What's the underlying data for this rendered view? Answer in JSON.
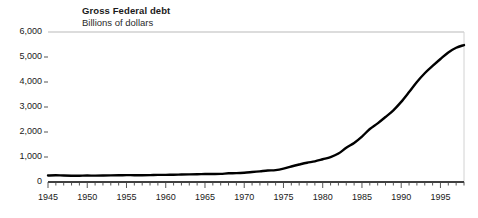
{
  "chart_data": {
    "type": "line",
    "title": "Gross Federal debt",
    "subtitle": "Billions of dollars",
    "xlabel": "",
    "ylabel": "",
    "ylim": [
      0,
      6000
    ],
    "xlim": [
      1945,
      1998
    ],
    "grid": "top-line-only",
    "legend": "none",
    "line_color": "#000000",
    "axis_color": "#000000",
    "gridline_color": "#b9b9b9",
    "ytick_labels": [
      "6,000",
      "5,000",
      "4,000",
      "3,000",
      "2,000",
      "1,000",
      "0"
    ],
    "ytick_values": [
      6000,
      5000,
      4000,
      3000,
      2000,
      1000,
      0
    ],
    "xtick_labels": [
      "1945",
      "1950",
      "1955",
      "1960",
      "1965",
      "1970",
      "1975",
      "1980",
      "1985",
      "1990",
      "1995"
    ],
    "xtick_values": [
      1945,
      1950,
      1955,
      1960,
      1965,
      1970,
      1975,
      1980,
      1985,
      1990,
      1995
    ],
    "x": [
      1945,
      1946,
      1947,
      1948,
      1949,
      1950,
      1951,
      1952,
      1953,
      1954,
      1955,
      1956,
      1957,
      1958,
      1959,
      1960,
      1961,
      1962,
      1963,
      1964,
      1965,
      1966,
      1967,
      1968,
      1969,
      1970,
      1971,
      1972,
      1973,
      1974,
      1975,
      1976,
      1977,
      1978,
      1979,
      1980,
      1981,
      1982,
      1983,
      1984,
      1985,
      1986,
      1987,
      1988,
      1989,
      1990,
      1991,
      1992,
      1993,
      1994,
      1995,
      1996,
      1997,
      1998
    ],
    "values": [
      260,
      271,
      257,
      252,
      253,
      257,
      255,
      259,
      266,
      271,
      274,
      273,
      271,
      276,
      285,
      286,
      289,
      298,
      306,
      312,
      317,
      320,
      326,
      348,
      354,
      371,
      398,
      427,
      458,
      475,
      533,
      620,
      699,
      772,
      827,
      909,
      994,
      1137,
      1371,
      1564,
      1817,
      2120,
      2346,
      2601,
      2868,
      3206,
      3598,
      4002,
      4351,
      4643,
      4921,
      5181,
      5369,
      5478
    ],
    "series": [
      {
        "name": "Gross Federal debt",
        "values": [
          260,
          271,
          257,
          252,
          253,
          257,
          255,
          259,
          266,
          271,
          274,
          273,
          271,
          276,
          285,
          286,
          289,
          298,
          306,
          312,
          317,
          320,
          326,
          348,
          354,
          371,
          398,
          427,
          458,
          475,
          533,
          620,
          699,
          772,
          827,
          909,
          994,
          1137,
          1371,
          1564,
          1817,
          2120,
          2346,
          2601,
          2868,
          3206,
          3598,
          4002,
          4351,
          4643,
          4921,
          5181,
          5369,
          5478
        ]
      }
    ]
  }
}
